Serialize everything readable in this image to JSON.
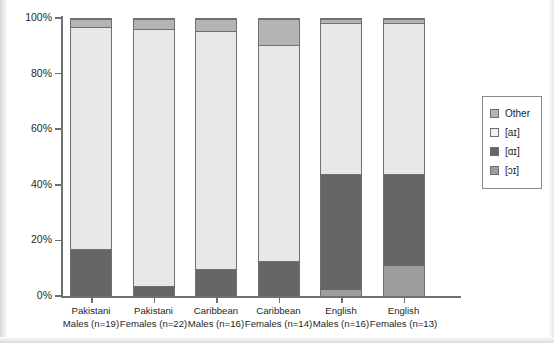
{
  "chart_data": {
    "type": "bar",
    "subtype": "stacked-percentage",
    "title": "",
    "xlabel": "",
    "ylabel": "",
    "ylim": [
      0,
      100
    ],
    "grid": false,
    "legend_position": "right",
    "ytick_labels": [
      "0%",
      "20%",
      "40%",
      "60%",
      "80%",
      "100%"
    ],
    "ytick_values": [
      0,
      20,
      40,
      60,
      80,
      100
    ],
    "categories": [
      "Pakistani Males (n=19)",
      "Pakistani Females (n=22)",
      "Caribbean Males (n=16)",
      "Caribbean Females (n=14)",
      "English Males (n=16)",
      "English Females (n=13)"
    ],
    "category_lines": [
      {
        "line1": "Pakistani",
        "line2": "Males (n=19)"
      },
      {
        "line1": "Pakistani",
        "line2": "Females (n=22)"
      },
      {
        "line1": "Caribbean",
        "line2": "Males (n=16)"
      },
      {
        "line1": "Caribbean",
        "line2": "Females (n=14)"
      },
      {
        "line1": "English",
        "line2": "Males (n=16)"
      },
      {
        "line1": "English",
        "line2": "Females (n=13)"
      }
    ],
    "series": [
      {
        "name": "[ɔɪ]",
        "color": "#9e9e9e",
        "values": [
          0,
          0,
          0,
          0,
          2,
          11
        ]
      },
      {
        "name": "[ɑɪ]",
        "color": "#666666",
        "values": [
          17,
          3.5,
          9.7,
          12.6,
          42,
          33
        ]
      },
      {
        "name": "[aɪ]",
        "color": "#e8e8e8",
        "values": [
          80,
          93,
          85.8,
          77.9,
          54.5,
          54.5
        ]
      },
      {
        "name": "Other",
        "color": "#b4b4b4",
        "values": [
          3,
          3.5,
          4.5,
          9.5,
          1.5,
          1.5
        ]
      }
    ],
    "legend": [
      {
        "label": "Other",
        "color": "#b4b4b4"
      },
      {
        "label": "[aɪ]",
        "color": "#f2f2f2"
      },
      {
        "label": "[ɑɪ]",
        "color": "#666666"
      },
      {
        "label": "[ɔɪ]",
        "color": "#9e9e9e"
      }
    ]
  }
}
